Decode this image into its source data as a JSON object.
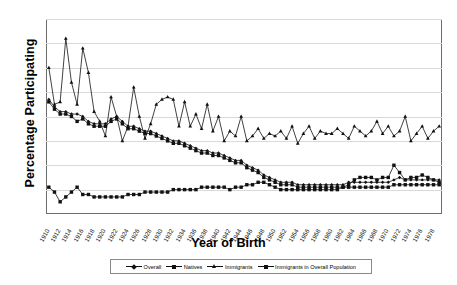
{
  "chart_data": {
    "type": "line",
    "title": "",
    "xlabel": "Year of Birth",
    "ylabel": "Percentage Participating",
    "ylim": [
      0,
      80
    ],
    "yticks": [
      0,
      10,
      20,
      30,
      40,
      50,
      60,
      70,
      80
    ],
    "grid": true,
    "legend_position": "bottom",
    "x": [
      1910,
      1911,
      1912,
      1913,
      1914,
      1915,
      1916,
      1917,
      1918,
      1919,
      1920,
      1921,
      1922,
      1923,
      1924,
      1925,
      1926,
      1927,
      1928,
      1929,
      1930,
      1931,
      1932,
      1933,
      1934,
      1935,
      1936,
      1937,
      1938,
      1939,
      1940,
      1941,
      1942,
      1943,
      1944,
      1945,
      1946,
      1947,
      1948,
      1949,
      1950,
      1951,
      1952,
      1953,
      1954,
      1955,
      1956,
      1957,
      1958,
      1959,
      1960,
      1961,
      1962,
      1963,
      1964,
      1965,
      1966,
      1967,
      1968,
      1969,
      1970,
      1971,
      1972,
      1973,
      1974,
      1975,
      1976,
      1977,
      1978,
      1979
    ],
    "xtick_labels": [
      "1910",
      "1912",
      "1914",
      "1916",
      "1918",
      "1920",
      "1922",
      "1924",
      "1926",
      "1928",
      "1930",
      "1932",
      "1934",
      "1936",
      "1938",
      "1940",
      "1942",
      "1944",
      "1946",
      "1948",
      "1950",
      "1952",
      "1954",
      "1956",
      "1958",
      "1960",
      "1962",
      "1964",
      "1966",
      "1968",
      "1970",
      "1972",
      "1974",
      "1976",
      "1978"
    ],
    "xtick_step": 2,
    "series": [
      {
        "name": "Overall",
        "marker": "diamond",
        "values": [
          47,
          44,
          42,
          42,
          41,
          41,
          40,
          38,
          37,
          37,
          37,
          39,
          40,
          38,
          36,
          36,
          35,
          34,
          34,
          33,
          32,
          31,
          30,
          30,
          29,
          28,
          27,
          26,
          26,
          25,
          25,
          24,
          23,
          22,
          22,
          20,
          19,
          18,
          16,
          15,
          14,
          13,
          13,
          13,
          12,
          12,
          12,
          12,
          12,
          12,
          12,
          12,
          12,
          13,
          13,
          13,
          13,
          13,
          13,
          13,
          13,
          14,
          15,
          14,
          14,
          14,
          14,
          14,
          14,
          14
        ]
      },
      {
        "name": "Natives",
        "marker": "square",
        "values": [
          46,
          43,
          41,
          41,
          40,
          38,
          39,
          37,
          36,
          36,
          36,
          38,
          39,
          37,
          35,
          35,
          34,
          33,
          33,
          32,
          31,
          30,
          29,
          29,
          28,
          27,
          26,
          25,
          25,
          24,
          24,
          23,
          22,
          21,
          21,
          19,
          18,
          17,
          15,
          14,
          13,
          12,
          12,
          12,
          11,
          11,
          11,
          11,
          11,
          11,
          11,
          11,
          11,
          11,
          11,
          11,
          11,
          11,
          11,
          11,
          11,
          12,
          12,
          12,
          12,
          12,
          12,
          12,
          12,
          12
        ]
      },
      {
        "name": "Immigrants",
        "marker": "triangle",
        "values": [
          60,
          45,
          46,
          72,
          54,
          45,
          68,
          58,
          42,
          38,
          32,
          48,
          40,
          30,
          36,
          52,
          40,
          31,
          37,
          45,
          47,
          48,
          47,
          36,
          46,
          36,
          41,
          35,
          45,
          34,
          40,
          30,
          34,
          32,
          40,
          30,
          32,
          35,
          31,
          33,
          32,
          34,
          31,
          36,
          29,
          33,
          36,
          31,
          34,
          33,
          33,
          35,
          33,
          31,
          36,
          34,
          32,
          34,
          38,
          33,
          36,
          32,
          34,
          40,
          30,
          33,
          36,
          31,
          34,
          36
        ]
      },
      {
        "name": "Immigrants in Overall Population",
        "marker": "square",
        "values": [
          11,
          9,
          5,
          7,
          9,
          11,
          8,
          8,
          7,
          7,
          7,
          7,
          7,
          7,
          8,
          8,
          8,
          9,
          9,
          9,
          9,
          9,
          10,
          10,
          10,
          10,
          10,
          11,
          11,
          11,
          11,
          11,
          10,
          11,
          11,
          12,
          12,
          13,
          13,
          12,
          11,
          10,
          10,
          10,
          10,
          10,
          10,
          10,
          10,
          10,
          10,
          10,
          11,
          12,
          14,
          15,
          15,
          15,
          14,
          15,
          15,
          20,
          17,
          14,
          15,
          15,
          16,
          15,
          14,
          13
        ]
      }
    ]
  },
  "legend": {
    "items": [
      {
        "label": "Overall"
      },
      {
        "label": "Natives"
      },
      {
        "label": "Immigrants"
      },
      {
        "label": "Immigrants in Overall Population"
      }
    ]
  }
}
